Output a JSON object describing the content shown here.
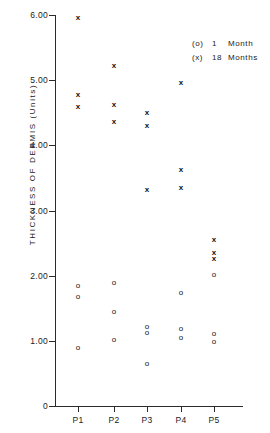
{
  "chart_data": {
    "type": "scatter",
    "title": "",
    "xlabel": "",
    "ylabel": "THICKNESS  OF  DERMIS    (Units)",
    "ylim": [
      0,
      6.0
    ],
    "yticks": [
      0,
      1.0,
      2.0,
      3.0,
      4.0,
      5.0,
      6.0
    ],
    "ytick_labels": [
      "0",
      "1.00",
      "2.00",
      "3.00",
      "4.00",
      "5.00",
      "6.00"
    ],
    "categories": [
      "P1",
      "P2",
      "P3",
      "P4",
      "P5"
    ],
    "grid": false,
    "legend_position": "top-right",
    "series": [
      {
        "name": "1 Month",
        "marker": "o",
        "legend_symbol": "(o)",
        "legend_number": "1",
        "legend_unit": "Month",
        "points": [
          {
            "category": "P1",
            "value": 1.84
          },
          {
            "category": "P1",
            "value": 1.67
          },
          {
            "category": "P1",
            "value": 0.89
          },
          {
            "category": "P2",
            "value": 1.89
          },
          {
            "category": "P2",
            "value": 1.45
          },
          {
            "category": "P2",
            "value": 1.01
          },
          {
            "category": "P3",
            "value": 1.21
          },
          {
            "category": "P3",
            "value": 1.12
          },
          {
            "category": "P3",
            "value": 0.64
          },
          {
            "category": "P4",
            "value": 1.73
          },
          {
            "category": "P4",
            "value": 1.18
          },
          {
            "category": "P4",
            "value": 1.04
          },
          {
            "category": "P5",
            "value": 2.01
          },
          {
            "category": "P5",
            "value": 1.1
          },
          {
            "category": "P5",
            "value": 0.98
          }
        ]
      },
      {
        "name": "18 Months",
        "marker": "x",
        "legend_symbol": "(x)",
        "legend_number": "18",
        "legend_unit": "Months",
        "points": [
          {
            "category": "P1",
            "value": 5.95
          },
          {
            "category": "P1",
            "value": 4.77
          },
          {
            "category": "P1",
            "value": 4.59
          },
          {
            "category": "P2",
            "value": 5.21
          },
          {
            "category": "P2",
            "value": 4.62
          },
          {
            "category": "P2",
            "value": 4.36
          },
          {
            "category": "P3",
            "value": 4.49
          },
          {
            "category": "P3",
            "value": 4.29
          },
          {
            "category": "P3",
            "value": 3.31
          },
          {
            "category": "P4",
            "value": 4.95
          },
          {
            "category": "P4",
            "value": 3.62
          },
          {
            "category": "P4",
            "value": 3.34
          },
          {
            "category": "P5",
            "value": 2.55
          },
          {
            "category": "P5",
            "value": 2.35
          },
          {
            "category": "P5",
            "value": 2.25
          }
        ]
      }
    ]
  },
  "axis": {
    "y_title": "THICKNESS  OF  DERMIS    (Units)"
  },
  "colors": {
    "axis": "#2b2b2b",
    "marker": "#111111",
    "background": "#ffffff"
  }
}
